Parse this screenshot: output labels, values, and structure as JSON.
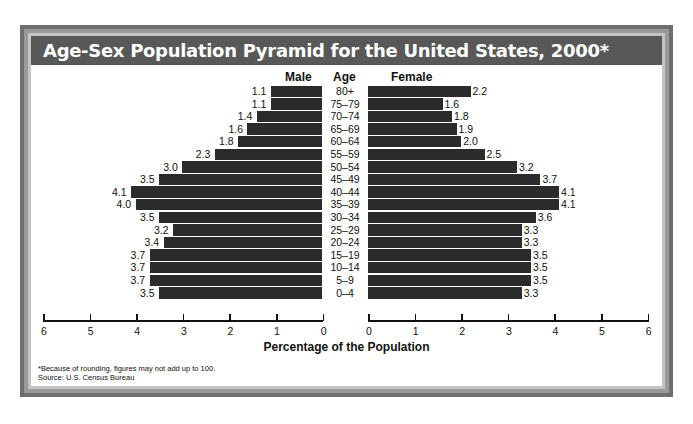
{
  "title": "Age-Sex Population Pyramid for the United States, 2000*",
  "headers": {
    "male": "Male",
    "age": "Age",
    "female": "Female"
  },
  "x_axis_label": "Percentage of the Population",
  "footnote": "*Because of rounding, figures may not add up to 100.",
  "source": "Source: U.S. Census Bureau",
  "colors": {
    "bar": "#2b2b2b",
    "title_bg": "#585858",
    "frame": "#6e6e6e"
  },
  "chart_data": {
    "type": "bar",
    "subtype": "population-pyramid",
    "title": "Age-Sex Population Pyramid for the United States, 2000*",
    "xlabel": "Percentage of the Population",
    "ylabel": "Age",
    "categories": [
      "80+",
      "75–79",
      "70–74",
      "65–69",
      "60–64",
      "55–59",
      "50–54",
      "45–49",
      "40–44",
      "35–39",
      "30–34",
      "25–29",
      "20–24",
      "15–19",
      "10–14",
      "5–9",
      "0–4"
    ],
    "series": [
      {
        "name": "Male",
        "values": [
          1.1,
          1.1,
          1.4,
          1.6,
          1.8,
          2.3,
          3.0,
          3.5,
          4.1,
          4.0,
          3.5,
          3.2,
          3.4,
          3.7,
          3.7,
          3.7,
          3.5
        ]
      },
      {
        "name": "Female",
        "values": [
          2.2,
          1.6,
          1.8,
          1.9,
          2.0,
          2.5,
          3.2,
          3.7,
          4.1,
          4.1,
          3.6,
          3.3,
          3.3,
          3.5,
          3.5,
          3.5,
          3.3
        ]
      }
    ],
    "male_ticks": [
      "6",
      "5",
      "4",
      "3",
      "2",
      "1",
      "0"
    ],
    "female_ticks": [
      "0",
      "1",
      "2",
      "3",
      "4",
      "5",
      "6"
    ],
    "xlim": [
      0,
      6
    ],
    "grid": false,
    "legend": "none; series labeled by column headers Male / Female",
    "footnote": "*Because of rounding, figures may not add up to 100.",
    "source": "Source: U.S. Census Bureau"
  }
}
